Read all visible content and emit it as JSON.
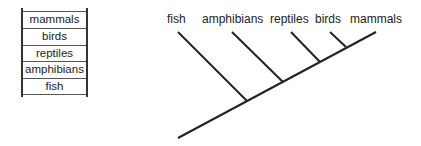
{
  "ladder": {
    "items": [
      {
        "label": "mammals"
      },
      {
        "label": "birds"
      },
      {
        "label": "reptiles"
      },
      {
        "label": "amphibians"
      },
      {
        "label": "fish"
      }
    ]
  },
  "tree": {
    "labels": [
      {
        "label": "fish"
      },
      {
        "label": "amphibians"
      },
      {
        "label": "reptiles"
      },
      {
        "label": "birds"
      },
      {
        "label": "mammals"
      }
    ],
    "line_color": "#222222"
  }
}
